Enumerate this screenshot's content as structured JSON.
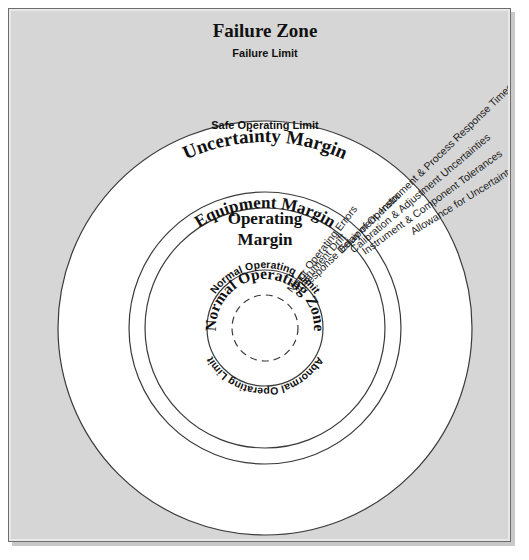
{
  "figure": {
    "type": "concentric-zone-diagram",
    "background_color": "#d6d6d6",
    "ring_fill_color": "#ffffff",
    "line_color": "#3a3a3a",
    "center": {
      "x": 256,
      "y": 319
    },
    "rings": [
      {
        "id": "failure-zone",
        "radius": 0,
        "fill": "#d6d6d6"
      },
      {
        "id": "uncertainty-margin",
        "radius": 207,
        "fill": "#ffffff"
      },
      {
        "id": "equipment-margin",
        "radius": 136,
        "fill": "#ffffff"
      },
      {
        "id": "operating-margin",
        "radius": 120,
        "fill": "#ffffff"
      },
      {
        "id": "normal-operating-zone",
        "radius": 58,
        "fill": "#ffffff"
      },
      {
        "id": "inner-dashed",
        "radius": 33,
        "fill": "#ffffff",
        "dashed": true
      }
    ]
  },
  "zones": {
    "failure_zone": "Failure Zone",
    "uncertainty_margin": "Uncertainty Margin",
    "equipment_margin": "Equipment Margin",
    "operating_margin_line1": "Operating",
    "operating_margin_line2": "Margin",
    "normal_operating_zone": "Normal Operating Zone"
  },
  "limits": {
    "failure_limit": "Failure Limit",
    "safe_operating_limit": "Safe Operating Limit",
    "normal_operating_limit": "Normal Operating Limit",
    "abnormal_operating_limit": "Abnormal Operating Limit"
  },
  "radial_labels": [
    {
      "id": "allowance-uncertainty",
      "text": "Allowance for Uncertainty Regarding Onset of Failure"
    },
    {
      "id": "instrument-component-tolerances",
      "text": "Instrument & Component Tolerances"
    },
    {
      "id": "calibration-adjustment-uncertainties",
      "text": "Calibration & Adjustment Uncertainties"
    },
    {
      "id": "equipment-instrument-process-response-times",
      "text": "Equipment, Instrument & Process Response Times"
    },
    {
      "id": "response-delay-of-operator",
      "text": "Response Delay of Operator"
    },
    {
      "id": "instrument-drift",
      "text": "Instrument Drift"
    },
    {
      "id": "minor-operating-errors",
      "text": "Minor Operating Errors"
    }
  ]
}
